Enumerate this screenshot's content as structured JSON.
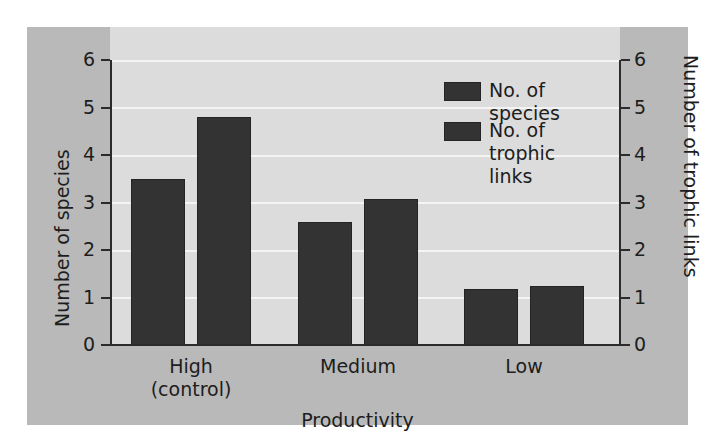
{
  "chart_data": {
    "type": "bar",
    "title": "",
    "xlabel": "Productivity",
    "ylabel": "Number of species",
    "y2label": "Number of trophic links",
    "categories": [
      "High\n(control)",
      "Medium",
      "Low"
    ],
    "category_lines": [
      [
        "High",
        "(control)"
      ],
      [
        "Medium"
      ],
      [
        "Low"
      ]
    ],
    "series": [
      {
        "name": "No. of species",
        "axis": "left",
        "color": "#333333",
        "values": [
          3.5,
          2.6,
          1.18
        ]
      },
      {
        "name": "No. of trophic links",
        "axis": "right",
        "color": "#333333",
        "values": [
          4.8,
          3.07,
          1.25
        ]
      }
    ],
    "ylim": [
      0,
      6
    ],
    "y2lim": [
      0,
      6
    ],
    "yticks": [
      "0",
      "1",
      "2",
      "3",
      "4",
      "5",
      "6"
    ],
    "y2ticks": [
      "0",
      "1",
      "2",
      "3",
      "4",
      "5",
      "6"
    ],
    "grid": true,
    "grid_color": "#f4f4f4",
    "legend_position": "top-right",
    "legend": [
      {
        "label": "No. of species",
        "swatch_color": "#333333"
      },
      {
        "label": "No. of trophic\nlinks",
        "swatch_color": "#333333"
      }
    ],
    "panel_color": "#b9b9b9",
    "plot_background": "#dcdcdc",
    "axis_color": "#2b2b2b"
  },
  "figure": {
    "left_axis_title": "Number of species",
    "right_axis_title": "Number of trophic links",
    "x_axis_title": "Productivity"
  }
}
